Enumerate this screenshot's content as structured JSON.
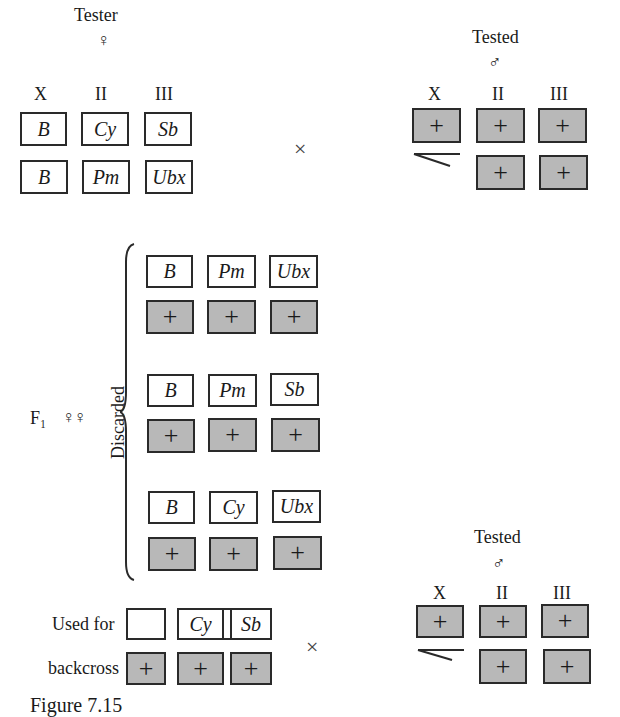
{
  "tester": {
    "title": "Tester",
    "sex_symbol": "♀",
    "columns": [
      "X",
      "II",
      "III"
    ],
    "rows": [
      [
        "B",
        "Cy",
        "Sb"
      ],
      [
        "B",
        "Pm",
        "Ubx"
      ]
    ]
  },
  "cross_symbol": "×",
  "tested_top": {
    "title": "Tested",
    "sex_symbol": "♂",
    "columns": [
      "X",
      "II",
      "III"
    ],
    "rows": [
      [
        "+",
        "+",
        "+"
      ],
      [
        "",
        "+",
        "+"
      ]
    ],
    "y_chromosome": "Y (hooked line)"
  },
  "f1": {
    "label": "F₁",
    "sex_symbol": "♀♀",
    "group_label": "Discarded",
    "groups": [
      {
        "mutant": [
          "B",
          "Pm",
          "Ubx"
        ],
        "wild": [
          "+",
          "+",
          "+"
        ]
      },
      {
        "mutant": [
          "B",
          "Pm",
          "Sb"
        ],
        "wild": [
          "+",
          "+",
          "+"
        ]
      },
      {
        "mutant": [
          "B",
          "Cy",
          "Ubx"
        ],
        "wild": [
          "+",
          "+",
          "+"
        ]
      }
    ]
  },
  "backcross": {
    "label_line1": "Used for",
    "label_line2": "backcross",
    "mutant": [
      "B",
      "Cy",
      "Sb"
    ],
    "wild": [
      "+",
      "+",
      "+"
    ]
  },
  "tested_bottom": {
    "title": "Tested",
    "sex_symbol": "♂",
    "columns": [
      "X",
      "II",
      "III"
    ],
    "rows": [
      [
        "+",
        "+",
        "+"
      ],
      [
        "",
        "+",
        "+"
      ]
    ]
  },
  "caption": "Figure 7.15"
}
